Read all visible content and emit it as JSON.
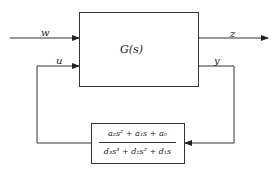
{
  "diagram": {
    "plant_block": {
      "label": "G(s)"
    },
    "controller_block": {
      "numerator": "a₂s² + a₁s + a₀",
      "denominator": "d₃s³ + d₂s² + d₁s"
    },
    "signals": {
      "w": "w",
      "u": "u",
      "z": "z",
      "y": "y"
    }
  }
}
